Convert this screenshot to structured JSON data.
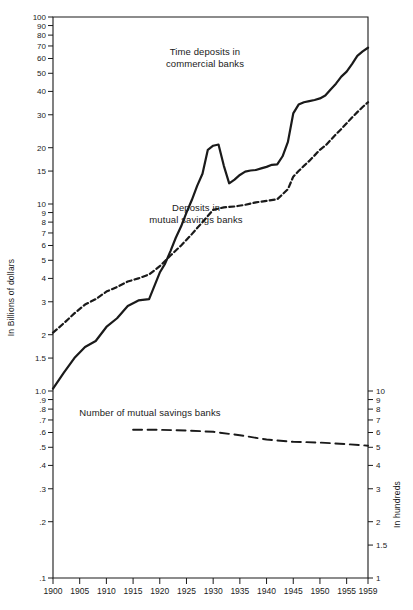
{
  "chart_data": {
    "type": "line",
    "title": "",
    "xlabel": "",
    "ylabel": "In Billions of dollars",
    "ylabel_right": "In hundreds",
    "scale": "log",
    "grid": false,
    "legend_position": "inline-annotations",
    "xlim": [
      1900,
      1959
    ],
    "ylim_left": [
      0.1,
      100
    ],
    "ylim_right": [
      1,
      10
    ],
    "x_ticks": [
      "1900",
      "1905",
      "1910",
      "1915",
      "1920",
      "1925",
      "1930",
      "1935",
      "1940",
      "1945",
      "1950",
      "1955",
      "1959"
    ],
    "y_ticks_left": [
      "100",
      "90",
      "80",
      "70",
      "60",
      "50",
      "40",
      "30",
      "20",
      "15",
      "10",
      "9",
      "8",
      "7",
      "6",
      "5",
      "4",
      "3",
      "2",
      "1.5",
      "1.0",
      ".9",
      ".8",
      ".7",
      ".6",
      ".5",
      ".4",
      ".3",
      ".2",
      ".1"
    ],
    "y_ticks_right": [
      "10",
      "9",
      "8",
      "7",
      "6",
      "5",
      "4",
      "3",
      "2",
      "1.5",
      "1"
    ],
    "series": [
      {
        "name": "Time deposits in commercial banks",
        "style": "solid",
        "axis": "left",
        "units": "billions of dollars",
        "x": [
          1900,
          1902,
          1904,
          1906,
          1908,
          1910,
          1912,
          1914,
          1916,
          1918,
          1920,
          1921,
          1922,
          1923,
          1924,
          1925,
          1926,
          1927,
          1928,
          1929,
          1930,
          1931,
          1932,
          1933,
          1934,
          1935,
          1936,
          1937,
          1938,
          1939,
          1940,
          1941,
          1942,
          1943,
          1944,
          1945,
          1946,
          1947,
          1948,
          1949,
          1950,
          1951,
          1952,
          1953,
          1954,
          1955,
          1956,
          1957,
          1958,
          1959
        ],
        "y": [
          1.03,
          1.25,
          1.5,
          1.72,
          1.85,
          2.2,
          2.45,
          2.85,
          3.05,
          3.1,
          4.3,
          4.8,
          5.6,
          6.6,
          7.6,
          9.0,
          10.5,
          12.5,
          14.5,
          19.5,
          20.5,
          20.8,
          16.0,
          12.9,
          13.5,
          14.3,
          14.9,
          15.1,
          15.2,
          15.5,
          15.8,
          16.2,
          16.3,
          18.0,
          21.5,
          30.5,
          34.0,
          35.0,
          35.5,
          36.0,
          36.7,
          38.0,
          41.0,
          44.0,
          48.0,
          51.0,
          56.0,
          62.0,
          65.5,
          68.5
        ]
      },
      {
        "name": "Deposits in mutual savings banks",
        "style": "dashed",
        "axis": "left",
        "units": "billions of dollars",
        "x": [
          1900,
          1902,
          1904,
          1906,
          1908,
          1910,
          1912,
          1914,
          1916,
          1918,
          1920,
          1922,
          1924,
          1926,
          1928,
          1930,
          1932,
          1934,
          1936,
          1938,
          1940,
          1942,
          1944,
          1945,
          1946,
          1947,
          1948,
          1949,
          1950,
          1951,
          1952,
          1953,
          1954,
          1955,
          1956,
          1957,
          1958,
          1959
        ],
        "y": [
          2.05,
          2.3,
          2.6,
          2.9,
          3.1,
          3.4,
          3.6,
          3.85,
          4.0,
          4.2,
          4.65,
          5.3,
          6.0,
          6.9,
          8.0,
          9.3,
          9.6,
          9.7,
          9.9,
          10.2,
          10.4,
          10.6,
          12.0,
          14.0,
          15.0,
          16.0,
          17.0,
          18.2,
          19.5,
          20.5,
          22.0,
          23.6,
          25.2,
          27.0,
          29.0,
          31.0,
          33.0,
          35.0
        ]
      },
      {
        "name": "Number of mutual savings banks",
        "style": "long-dashed",
        "axis": "right",
        "units": "hundreds of banks",
        "x": [
          1915,
          1920,
          1925,
          1930,
          1935,
          1940,
          1945,
          1950,
          1955,
          1959
        ],
        "y": [
          6.2,
          6.2,
          6.15,
          6.05,
          5.8,
          5.5,
          5.35,
          5.3,
          5.2,
          5.1
        ]
      }
    ],
    "annotations": [
      {
        "id": "annot-time-deposits",
        "text_lines": [
          "Time deposits in",
          "commercial banks"
        ],
        "x_px": 205,
        "y_px": 55
      },
      {
        "id": "annot-mutual-savings",
        "text_lines": [
          "Deposits in",
          "mutual savings banks"
        ],
        "x_px": 196,
        "y_px": 211
      },
      {
        "id": "annot-bank-count",
        "text_lines": [
          "Number of mutual savings banks"
        ],
        "x_px": 150,
        "y_px": 416
      }
    ]
  },
  "colors": {
    "ink": "#1a1a1a",
    "background": "#ffffff"
  }
}
